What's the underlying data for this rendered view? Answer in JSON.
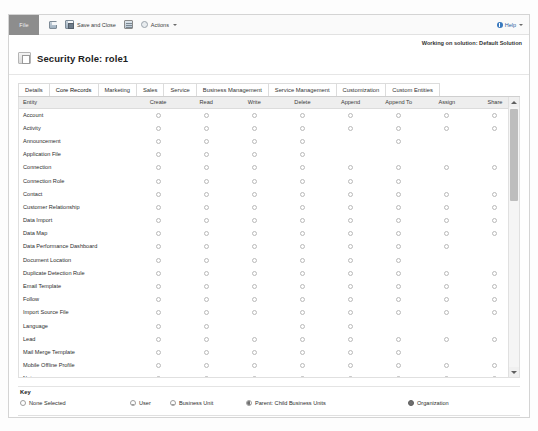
{
  "ribbon": {
    "file_tab": "File",
    "save_label": "Save",
    "save_and_close_label": "Save and Close",
    "new_label": "New",
    "actions_label": "Actions",
    "help_label": "Help"
  },
  "header": {
    "solution_note": "Working on solution: Default Solution",
    "page_title": "Security Role: role1"
  },
  "tabs": [
    {
      "label": "Details",
      "active": false
    },
    {
      "label": "Core Records",
      "active": true
    },
    {
      "label": "Marketing",
      "active": false
    },
    {
      "label": "Sales",
      "active": false
    },
    {
      "label": "Service",
      "active": false
    },
    {
      "label": "Business Management",
      "active": false
    },
    {
      "label": "Service Management",
      "active": false
    },
    {
      "label": "Customization",
      "active": false
    },
    {
      "label": "Custom Entities",
      "active": false
    }
  ],
  "grid": {
    "columns": [
      "Entity",
      "Create",
      "Read",
      "Write",
      "Delete",
      "Append",
      "Append To",
      "Assign",
      "Share"
    ],
    "rows": [
      {
        "entity": "Account",
        "cells": [
          1,
          1,
          1,
          1,
          1,
          1,
          1,
          1
        ]
      },
      {
        "entity": "Activity",
        "cells": [
          1,
          1,
          1,
          1,
          1,
          1,
          1,
          1
        ]
      },
      {
        "entity": "Announcement",
        "cells": [
          1,
          1,
          1,
          1,
          0,
          1,
          0,
          0
        ]
      },
      {
        "entity": "Application File",
        "cells": [
          1,
          1,
          1,
          1,
          0,
          0,
          0,
          0
        ]
      },
      {
        "entity": "Connection",
        "cells": [
          1,
          1,
          1,
          1,
          1,
          1,
          1,
          1
        ]
      },
      {
        "entity": "Connection Role",
        "cells": [
          1,
          1,
          1,
          1,
          1,
          1,
          0,
          0
        ]
      },
      {
        "entity": "Contact",
        "cells": [
          1,
          1,
          1,
          1,
          1,
          1,
          1,
          1
        ]
      },
      {
        "entity": "Customer Relationship",
        "cells": [
          1,
          1,
          1,
          1,
          1,
          1,
          1,
          1
        ]
      },
      {
        "entity": "Data Import",
        "cells": [
          1,
          1,
          1,
          1,
          1,
          1,
          1,
          1
        ]
      },
      {
        "entity": "Data Map",
        "cells": [
          1,
          1,
          1,
          1,
          1,
          1,
          1,
          1
        ]
      },
      {
        "entity": "Data Performance Dashboard",
        "cells": [
          1,
          1,
          1,
          1,
          1,
          1,
          1,
          0
        ]
      },
      {
        "entity": "Document Location",
        "cells": [
          1,
          1,
          1,
          1,
          1,
          1,
          0,
          0
        ]
      },
      {
        "entity": "Duplicate Detection Rule",
        "cells": [
          1,
          1,
          1,
          1,
          1,
          1,
          1,
          1
        ]
      },
      {
        "entity": "Email Template",
        "cells": [
          1,
          1,
          1,
          1,
          1,
          1,
          1,
          1
        ]
      },
      {
        "entity": "Follow",
        "cells": [
          1,
          1,
          1,
          1,
          1,
          1,
          1,
          1
        ]
      },
      {
        "entity": "Import Source File",
        "cells": [
          1,
          1,
          1,
          1,
          1,
          1,
          1,
          1
        ]
      },
      {
        "entity": "Language",
        "cells": [
          1,
          1,
          0,
          1,
          1,
          0,
          0,
          0
        ]
      },
      {
        "entity": "Lead",
        "cells": [
          1,
          1,
          1,
          1,
          1,
          1,
          1,
          1
        ]
      },
      {
        "entity": "Mail Merge Template",
        "cells": [
          1,
          1,
          1,
          1,
          1,
          1,
          0,
          0
        ]
      },
      {
        "entity": "Mobile Offline Profile",
        "cells": [
          1,
          1,
          1,
          1,
          1,
          1,
          1,
          1
        ]
      },
      {
        "entity": "Note",
        "cells": [
          1,
          1,
          1,
          1,
          1,
          1,
          1,
          1
        ]
      },
      {
        "entity": "Office Graph Document",
        "cells": [
          0,
          1,
          0,
          0,
          0,
          0,
          0,
          0
        ]
      },
      {
        "entity": "Opportunity",
        "cells": [
          1,
          1,
          1,
          1,
          1,
          1,
          1,
          1
        ]
      }
    ]
  },
  "key": {
    "title": "Key",
    "items": [
      {
        "label": "None Selected",
        "fill": "none"
      },
      {
        "label": "User",
        "fill": "quarter"
      },
      {
        "label": "Business Unit",
        "fill": "half"
      },
      {
        "label": "Parent: Child Business Units",
        "fill": "three-quarter"
      },
      {
        "label": "Organization",
        "fill": "full"
      }
    ]
  }
}
